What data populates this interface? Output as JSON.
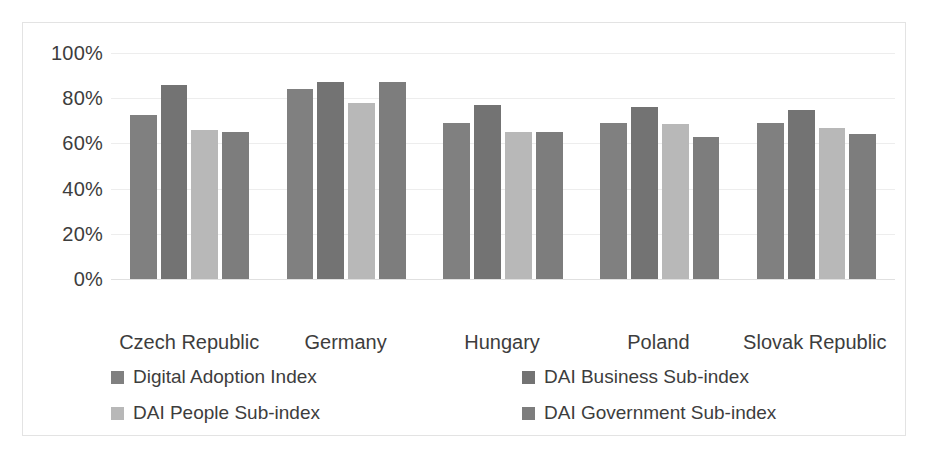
{
  "chart_data": {
    "type": "bar",
    "title": "",
    "subtitle": "",
    "xlabel": "",
    "ylabel": "",
    "categories": [
      "Czech Republic",
      "Germany",
      "Hungary",
      "Poland",
      "Slovak Republic"
    ],
    "series": [
      {
        "name": "Digital Adoption Index",
        "color": "#808080",
        "values": [
          72.5,
          84,
          69,
          69,
          69
        ]
      },
      {
        "name": "DAI Business Sub-index",
        "color": "#737373",
        "values": [
          86,
          87,
          77,
          76,
          75
        ]
      },
      {
        "name": "DAI People Sub-index",
        "color": "#b8b8b8",
        "values": [
          66,
          78,
          65,
          68.5,
          67
        ]
      },
      {
        "name": "DAI Government Sub-index",
        "color": "#7d7d7d",
        "values": [
          65,
          87,
          65,
          63,
          64
        ]
      }
    ],
    "ylim": [
      0,
      100
    ],
    "y_ticks": [
      0,
      20,
      40,
      60,
      80,
      100
    ],
    "y_tick_labels": [
      "0%",
      "20%",
      "40%",
      "60%",
      "80%",
      "100%"
    ],
    "grid": true,
    "grid_axis": "y",
    "legend_position": "bottom",
    "legend_columns": 2,
    "value_unit": "%"
  },
  "axes": {
    "y_tick_labels": [
      "100%",
      "80%",
      "60%",
      "40%",
      "20%",
      "0%"
    ]
  },
  "legend": {
    "items": [
      {
        "label": "Digital Adoption Index",
        "color": "#808080"
      },
      {
        "label": "DAI Business Sub-index",
        "color": "#737373"
      },
      {
        "label": "DAI People Sub-index",
        "color": "#b8b8b8"
      },
      {
        "label": "DAI Government Sub-index",
        "color": "#7d7d7d"
      }
    ]
  },
  "artifact": {
    "text": ""
  }
}
